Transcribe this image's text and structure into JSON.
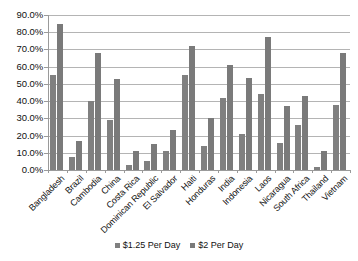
{
  "chart_data": {
    "type": "bar",
    "title": "",
    "xlabel": "",
    "ylabel": "",
    "ylim": [
      0,
      90
    ],
    "ytick_labels": [
      "90.0%",
      "80.0%",
      "70.0%",
      "60.0%",
      "50.0%",
      "40.0%",
      "30.0%",
      "20.0%",
      "10.0%",
      "0.0%"
    ],
    "ytick_values": [
      90,
      80,
      70,
      60,
      50,
      40,
      30,
      20,
      10,
      0
    ],
    "grid": true,
    "legend_position": "bottom",
    "categories": [
      "Bangladesh",
      "Brazil",
      "Cambodia",
      "China",
      "Costa Rica",
      "Dominican Republic",
      "El Salvador",
      "Haiti",
      "Honduras",
      "India",
      "Indonesia",
      "Laos",
      "Nicaragua",
      "South Africa",
      "Thailand",
      "Vietnam"
    ],
    "series": [
      {
        "name": "$1.25 Per Day",
        "color": "#808080",
        "values": [
          55.0,
          7.8,
          40.0,
          28.8,
          3.0,
          5.0,
          11.0,
          55.0,
          13.8,
          41.6,
          21.0,
          44.0,
          15.8,
          26.0,
          2.0,
          38.0
        ]
      },
      {
        "name": "$2 Per Day",
        "color": "#7a7a7a",
        "values": [
          84.5,
          17.0,
          68.0,
          53.0,
          11.0,
          15.0,
          23.0,
          72.0,
          30.0,
          61.0,
          53.5,
          77.0,
          37.0,
          43.0,
          11.0,
          68.0
        ]
      }
    ]
  },
  "legend": {
    "entries": [
      {
        "label": "$1.25 Per Day"
      },
      {
        "label": "$2 Per Day"
      }
    ]
  }
}
